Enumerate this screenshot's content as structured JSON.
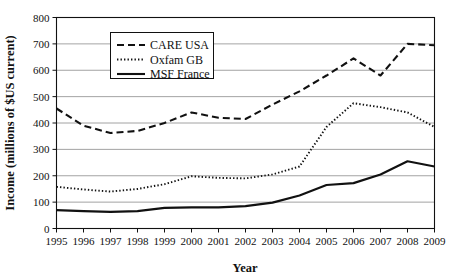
{
  "chart_data": {
    "type": "line",
    "title": "",
    "xlabel": "Year",
    "ylabel": "Income (millions of $US current)",
    "x": [
      1995,
      1996,
      1997,
      1998,
      1999,
      2000,
      2001,
      2002,
      2003,
      2004,
      2005,
      2006,
      2007,
      2008,
      2009
    ],
    "categories": [
      "1995",
      "1996",
      "1997",
      "1998",
      "1999",
      "2000",
      "2001",
      "2002",
      "2003",
      "2004",
      "2005",
      "2006",
      "2007",
      "2008",
      "2009"
    ],
    "xlim": [
      1995,
      2009
    ],
    "ylim": [
      0,
      800
    ],
    "yticks": [
      0,
      100,
      200,
      300,
      400,
      500,
      600,
      700,
      800
    ],
    "ytick_labels": [
      "0",
      "100",
      "200",
      "300",
      "400",
      "500",
      "600",
      "700",
      "800"
    ],
    "grid": "horizontal",
    "legend_position": "upper-left-inside",
    "series": [
      {
        "name": "CARE USA",
        "style": "dashed",
        "color": "#111111",
        "values": [
          455,
          390,
          362,
          370,
          400,
          440,
          420,
          415,
          470,
          520,
          580,
          645,
          580,
          700,
          695
        ]
      },
      {
        "name": "Oxfam GB",
        "style": "dotted",
        "color": "#111111",
        "values": [
          158,
          148,
          140,
          150,
          168,
          198,
          192,
          190,
          205,
          235,
          385,
          475,
          460,
          440,
          385
        ]
      },
      {
        "name": "MSF France",
        "style": "solid",
        "color": "#111111",
        "values": [
          70,
          66,
          63,
          66,
          78,
          80,
          80,
          85,
          98,
          125,
          165,
          172,
          205,
          255,
          235
        ]
      }
    ]
  },
  "axes": {
    "y_title": "Income (millions of $US current)",
    "x_title": "Year"
  },
  "legend": {
    "entries": [
      {
        "label": "CARE USA",
        "style": "dashed"
      },
      {
        "label": "Oxfam GB",
        "style": "dotted"
      },
      {
        "label": "MSF France",
        "style": "solid"
      }
    ]
  }
}
